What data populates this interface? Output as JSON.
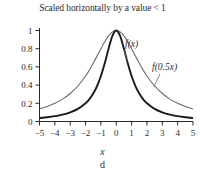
{
  "figure": {
    "title": "Scaled horizontally by a value < 1",
    "panel_caption": "d",
    "x_axis_label": "x",
    "background_color": "#ffffff"
  },
  "labels": {
    "curve_primary": "f(x)",
    "curve_scaled": "f(0.5x)"
  },
  "colors": {
    "curve_primary": "#1a1a1a",
    "curve_scaled": "#6b6b6b",
    "axis": "#2a2a2a",
    "text": "#2a2a2a"
  },
  "chart_data": {
    "type": "line",
    "title": "Scaled horizontally by a value < 1",
    "xlabel": "x",
    "ylabel": "",
    "xlim": [
      -5,
      5
    ],
    "ylim": [
      0,
      1.08
    ],
    "grid": false,
    "legend": "inline-annotations",
    "xticks": [
      -5,
      -4,
      -3,
      -2,
      -1,
      0,
      1,
      2,
      3,
      4,
      5
    ],
    "xticklabels": [
      "−5",
      "−4",
      "−3",
      "−2",
      "−1",
      "0",
      "1",
      "2",
      "3",
      "4",
      "5"
    ],
    "yticks": [
      0,
      0.2,
      0.4,
      0.6,
      0.8,
      1
    ],
    "yticklabels": [
      "0",
      "0.2",
      "0.4",
      "0.6",
      "0.8",
      "1"
    ],
    "annotations": [
      {
        "text": "f(x)",
        "x": 1.35,
        "y": 0.88,
        "points_to": {
          "x": 0.72,
          "y": 0.66
        }
      },
      {
        "text": "f(0.5x)",
        "x": 3.1,
        "y": 0.63,
        "points_to": {
          "x": 2.45,
          "y": 0.38
        }
      }
    ],
    "series": [
      {
        "name": "f(x)",
        "color": "#1a1a1a",
        "formula": "1/(1+x^2)",
        "x": [
          -5,
          -4.5,
          -4,
          -3.5,
          -3,
          -2.5,
          -2,
          -1.75,
          -1.5,
          -1.25,
          -1,
          -0.75,
          -0.5,
          -0.25,
          0,
          0.25,
          0.5,
          0.75,
          1,
          1.25,
          1.5,
          1.75,
          2,
          2.5,
          3,
          3.5,
          4,
          4.5,
          5
        ],
        "values": [
          0.038,
          0.047,
          0.059,
          0.075,
          0.1,
          0.138,
          0.2,
          0.246,
          0.308,
          0.39,
          0.5,
          0.64,
          0.8,
          0.941,
          1.0,
          0.941,
          0.8,
          0.64,
          0.5,
          0.39,
          0.308,
          0.246,
          0.2,
          0.138,
          0.1,
          0.075,
          0.059,
          0.047,
          0.038
        ]
      },
      {
        "name": "f(0.5x)",
        "color": "#6b6b6b",
        "formula": "1/(1+0.25x^2)",
        "x": [
          -5,
          -4.5,
          -4,
          -3.5,
          -3,
          -2.5,
          -2,
          -1.75,
          -1.5,
          -1.25,
          -1,
          -0.75,
          -0.5,
          -0.25,
          0,
          0.25,
          0.5,
          0.75,
          1,
          1.25,
          1.5,
          1.75,
          2,
          2.5,
          3,
          3.5,
          4,
          4.5,
          5
        ],
        "values": [
          0.138,
          0.165,
          0.2,
          0.246,
          0.308,
          0.39,
          0.5,
          0.566,
          0.64,
          0.719,
          0.8,
          0.877,
          0.941,
          0.985,
          1.0,
          0.985,
          0.941,
          0.877,
          0.8,
          0.719,
          0.64,
          0.566,
          0.5,
          0.39,
          0.308,
          0.246,
          0.2,
          0.165,
          0.138
        ]
      }
    ]
  }
}
